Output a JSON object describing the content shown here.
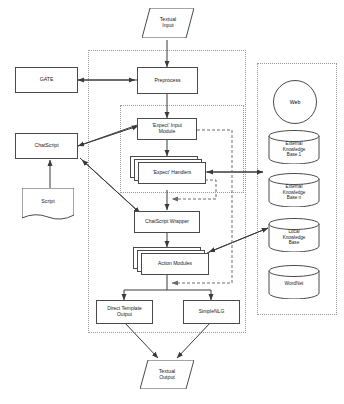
{
  "diagram": {
    "nodes": {
      "textual_input": "Textual\nInput",
      "preprocess": "Preprocess",
      "gate": "GATE",
      "chatscript": "ChatScript",
      "script": "Script",
      "expect_input_module": "'Expect' Input\nModule",
      "expect_handlers": "'Expect' Handlers",
      "chatscript_wrapper": "ChatScript Wrapper",
      "action_modules": "Action Modules",
      "direct_template_output": "Direct Template\nOutput",
      "simplenlg": "SimpleNLG",
      "textual_output": "Textual\nOutput",
      "web": "Web",
      "external_kb_1": "External\nKnowledge\nBase 1",
      "external_kb_n": "External\nKnowledge\nBase n",
      "local_kb": "Local\nKnowledge\nBase",
      "wordnet": "WordNet"
    },
    "colors": {
      "stroke": "#4a4a4a",
      "group_border": "#9a9a9a",
      "arrow": "#3a3a3a",
      "dashed_arrow": "#6a6a6a",
      "background": "#ffffff",
      "text": "#1a1a1a"
    }
  }
}
